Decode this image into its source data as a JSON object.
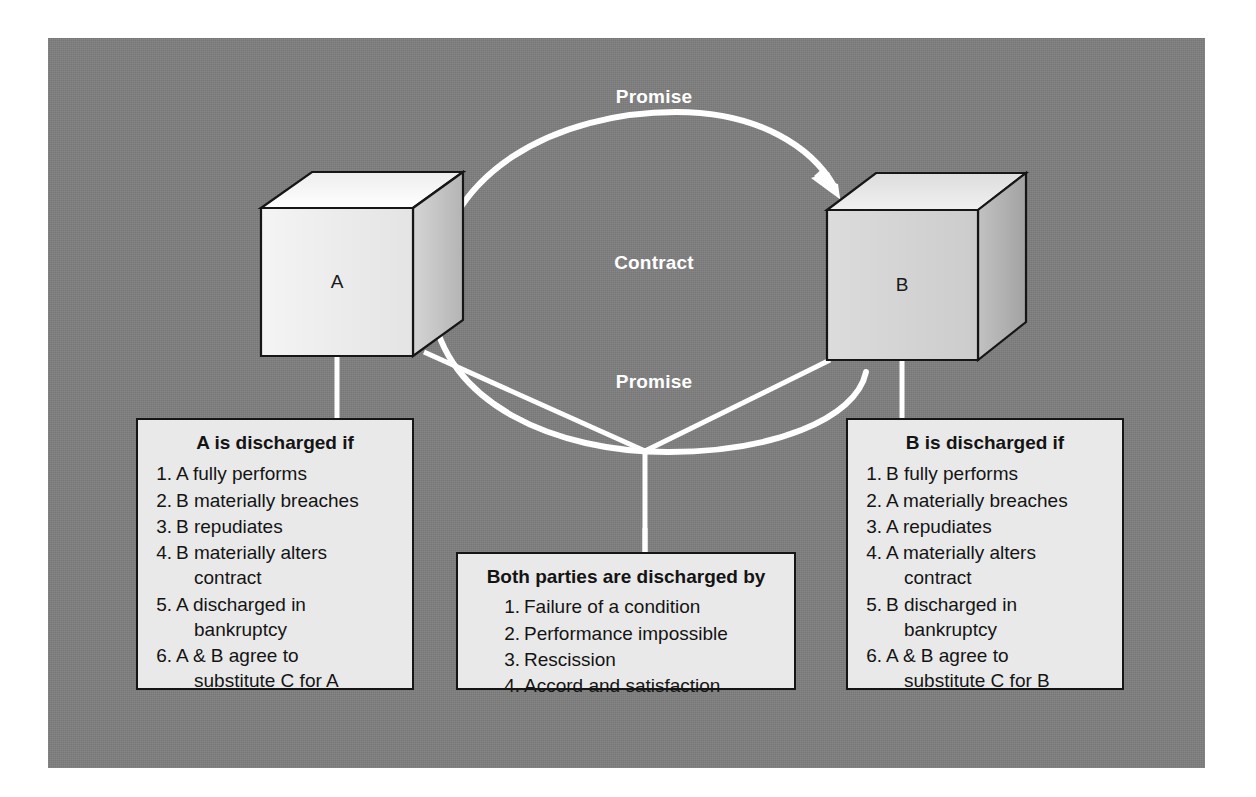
{
  "diagram": {
    "background_color": "#7f7f7f",
    "accent_color": "#ffffff",
    "nodes": [
      {
        "id": "A",
        "label": "A",
        "shape": "cube"
      },
      {
        "id": "B",
        "label": "B",
        "shape": "cube"
      }
    ],
    "edges": [
      {
        "id": "promise-top",
        "label": "Promise",
        "from": "A",
        "to": "B",
        "style": "curved-arrow"
      },
      {
        "id": "promise-bottom",
        "label": "Promise",
        "from": "B",
        "to": "A",
        "style": "curved-arrow"
      }
    ],
    "center_label": "Contract",
    "labels": {
      "promise_top": "Promise",
      "contract": "Contract",
      "promise_bottom": "Promise",
      "cube_a": "A",
      "cube_b": "B"
    }
  },
  "box_a": {
    "title": "A is discharged if",
    "items": [
      {
        "text": "A fully performs",
        "continuation": ""
      },
      {
        "text": "B materially breaches",
        "continuation": ""
      },
      {
        "text": "B repudiates",
        "continuation": ""
      },
      {
        "text": "B materially alters",
        "continuation": "contract"
      },
      {
        "text": "A discharged in",
        "continuation": "bankruptcy"
      },
      {
        "text": "A & B agree to",
        "continuation": "substitute C for A"
      }
    ]
  },
  "box_b": {
    "title": "B is discharged if",
    "items": [
      {
        "text": "B fully performs",
        "continuation": ""
      },
      {
        "text": "A materially breaches",
        "continuation": ""
      },
      {
        "text": "A repudiates",
        "continuation": ""
      },
      {
        "text": "A materially alters",
        "continuation": "contract"
      },
      {
        "text": "B discharged in",
        "continuation": "bankruptcy"
      },
      {
        "text": "A & B agree to",
        "continuation": "substitute C for B"
      }
    ]
  },
  "box_both": {
    "title": "Both parties are discharged by",
    "items": [
      {
        "text": "Failure of a condition",
        "continuation": ""
      },
      {
        "text": "Performance impossible",
        "continuation": ""
      },
      {
        "text": "Rescission",
        "continuation": ""
      },
      {
        "text": "Accord and satisfaction",
        "continuation": ""
      }
    ]
  }
}
